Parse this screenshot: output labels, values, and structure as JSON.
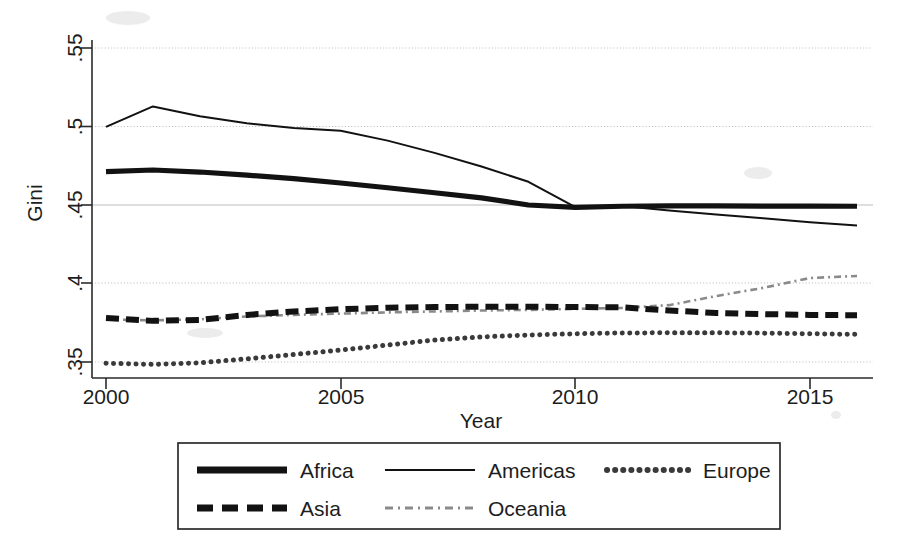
{
  "chart_data": {
    "type": "line",
    "title": "",
    "xlabel": "Year",
    "ylabel": "Gini",
    "xlim": [
      2000,
      2016
    ],
    "ylim": [
      0.345,
      0.5575
    ],
    "grid": true,
    "legend_position": "bottom",
    "x_ticks": [
      "2000",
      "2005",
      "2010",
      "2015"
    ],
    "x_tick_values": [
      2000,
      2005,
      2010,
      2015
    ],
    "y_ticks": [
      ".35",
      ".4",
      ".45",
      ".5",
      ".55"
    ],
    "y_tick_values": [
      0.35,
      0.4,
      0.45,
      0.5,
      0.55
    ],
    "x": [
      2000,
      2001,
      2002,
      2003,
      2004,
      2005,
      2006,
      2007,
      2008,
      2009,
      2010,
      2011,
      2012,
      2013,
      2014,
      2015,
      2016
    ],
    "series": [
      {
        "name": "Africa",
        "style": "thick-solid",
        "values": [
          0.4713,
          0.4723,
          0.471,
          0.469,
          0.4668,
          0.464,
          0.461,
          0.4578,
          0.4545,
          0.45,
          0.4485,
          0.4492,
          0.4494,
          0.4494,
          0.4493,
          0.4493,
          0.4492
        ]
      },
      {
        "name": "Americas",
        "style": "thin-solid",
        "values": [
          0.4998,
          0.5128,
          0.5065,
          0.502,
          0.499,
          0.4973,
          0.491,
          0.4832,
          0.4745,
          0.4648,
          0.4487,
          0.4493,
          0.4465,
          0.444,
          0.4415,
          0.439,
          0.437
        ]
      },
      {
        "name": "Europe",
        "style": "dotted",
        "values": [
          0.3492,
          0.3485,
          0.3495,
          0.352,
          0.3548,
          0.3576,
          0.3608,
          0.364,
          0.366,
          0.3672,
          0.368,
          0.3685,
          0.3686,
          0.3686,
          0.3684,
          0.368,
          0.3676
        ]
      },
      {
        "name": "Asia",
        "style": "thick-dashed",
        "values": [
          0.378,
          0.3762,
          0.3768,
          0.38,
          0.3822,
          0.3836,
          0.3846,
          0.385,
          0.3852,
          0.3852,
          0.385,
          0.3848,
          0.3828,
          0.3812,
          0.3805,
          0.38,
          0.3798
        ]
      },
      {
        "name": "Oceania",
        "style": "thin-dash-dot",
        "values": [
          0.3772,
          0.3765,
          0.3772,
          0.379,
          0.38,
          0.3808,
          0.3816,
          0.3822,
          0.3828,
          0.3832,
          0.3838,
          0.3845,
          0.3862,
          0.392,
          0.3972,
          0.4035,
          0.4048
        ]
      }
    ],
    "legend_entries": [
      {
        "label": "Africa",
        "style": "thick-solid"
      },
      {
        "label": "Americas",
        "style": "thin-solid"
      },
      {
        "label": "Europe",
        "style": "dotted"
      },
      {
        "label": "Asia",
        "style": "thick-dashed"
      },
      {
        "label": "Oceania",
        "style": "thin-dash-dot"
      }
    ]
  },
  "axes": {
    "y_title": "Gini",
    "x_title": "Year"
  }
}
